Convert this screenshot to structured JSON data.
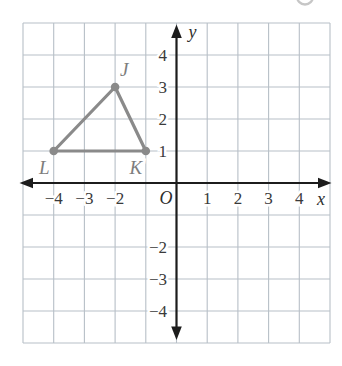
{
  "colors": {
    "background": "#ffffff",
    "grid": "#b7bfc7",
    "axis": "#1c1c1c",
    "tick_label": "#3a3a3a",
    "axis_label": "#2e2e2e",
    "triangle": "#8a8a8a",
    "vertex_label": "#7d7d7d",
    "stray_mark": "#c6c6c6"
  },
  "chart_data": {
    "type": "scatter",
    "title": "",
    "xlabel": "x",
    "ylabel": "y",
    "origin_label": "O",
    "xlim": [
      -5,
      5
    ],
    "ylim": [
      -5,
      5
    ],
    "grid": true,
    "grid_step": 1,
    "shape": "triangle",
    "points": [
      {
        "label": "J",
        "x": -2,
        "y": 3
      },
      {
        "label": "K",
        "x": -1,
        "y": 1
      },
      {
        "label": "L",
        "x": -4,
        "y": 1
      }
    ],
    "x_ticks": [
      {
        "v": -4,
        "label": "−4"
      },
      {
        "v": -3,
        "label": "−3"
      },
      {
        "v": -2,
        "label": "−2"
      },
      {
        "v": 1,
        "label": "1"
      },
      {
        "v": 2,
        "label": "2"
      },
      {
        "v": 3,
        "label": "3"
      },
      {
        "v": 4,
        "label": "4"
      }
    ],
    "y_ticks": [
      {
        "v": 4,
        "label": "4"
      },
      {
        "v": 3,
        "label": "3"
      },
      {
        "v": 2,
        "label": "2"
      },
      {
        "v": 1,
        "label": "1"
      },
      {
        "v": -2,
        "label": "−2"
      },
      {
        "v": -3,
        "label": "−3"
      },
      {
        "v": -4,
        "label": "−4"
      }
    ]
  }
}
